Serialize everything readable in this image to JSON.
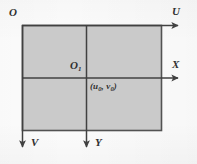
{
  "figure": {
    "type": "coordinate-systems-diagram",
    "canvas": {
      "width": 197,
      "height": 164
    },
    "colors": {
      "background": "#fdfdfd",
      "plane_fill": "#c9c9c9",
      "plane_stroke": "#4a4a4a",
      "axis_stroke": "#3a3a3a",
      "label_color": "#2a2a2a"
    },
    "plane": {
      "name": "image-plane-rectangle",
      "x": 22,
      "y": 25,
      "width": 140,
      "height": 106,
      "fill": "#c9c9c9"
    },
    "axes": [
      {
        "id": "u-axis",
        "label": "U",
        "direction": "right",
        "from": [
          22,
          25
        ],
        "to": [
          181,
          25
        ],
        "label_x": 172,
        "label_y": 8
      },
      {
        "id": "v-axis",
        "label": "V",
        "direction": "down",
        "from": [
          22,
          25
        ],
        "to": [
          22,
          150
        ],
        "label_x": 31,
        "label_y": 139
      },
      {
        "id": "x-axis",
        "label": "X",
        "direction": "right",
        "from": [
          22,
          78
        ],
        "to": [
          181,
          78
        ],
        "label_x": 172,
        "label_y": 61
      },
      {
        "id": "y-axis",
        "label": "Y",
        "direction": "down",
        "from": [
          86,
          25
        ],
        "to": [
          86,
          150
        ],
        "label_x": 95,
        "label_y": 139
      }
    ],
    "origins": [
      {
        "id": "origin-O",
        "label": "O",
        "subscript": "",
        "at": [
          22,
          25
        ],
        "label_x": 9,
        "label_y": 8
      },
      {
        "id": "origin-O1",
        "label": "O",
        "subscript": "1",
        "at": [
          86,
          78
        ],
        "label_x": 70,
        "label_y": 61
      }
    ],
    "annotations": [
      {
        "id": "principal-point-coords",
        "text_open": "(",
        "var1": "u",
        "sub1": "0",
        "sep": ", ",
        "var2": "v",
        "sub2": "0",
        "text_close": ")",
        "full_text": "(u0, v0)",
        "label_x": 90,
        "label_y": 84
      }
    ]
  }
}
